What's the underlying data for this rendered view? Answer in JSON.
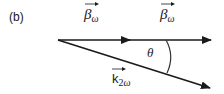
{
  "panel": {
    "label": "(b)"
  },
  "vectors": {
    "beta_left": {
      "symbol": "β",
      "subscript": "ω"
    },
    "beta_right": {
      "symbol": "β",
      "subscript": "ω"
    },
    "k": {
      "symbol": "k",
      "subscript_num": "2",
      "subscript": "ω"
    }
  },
  "angle": {
    "symbol": "θ"
  },
  "colors": {
    "stroke": "#1a1a1a",
    "background": "#ffffff"
  }
}
